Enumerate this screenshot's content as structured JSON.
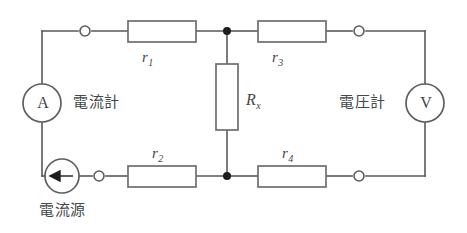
{
  "diagram": {
    "stroke_color": "#555a5e",
    "node_color": "#1b1d1f",
    "background": "#ffffff"
  },
  "instruments": {
    "ammeter": {
      "glyph": "A",
      "label": "電流計"
    },
    "voltmeter": {
      "glyph": "V",
      "label": "電圧計"
    },
    "current_source": {
      "label": "電流源",
      "arrow_direction": "left"
    }
  },
  "resistors": {
    "r1": {
      "symbol": "r",
      "subscript": "1"
    },
    "r2": {
      "symbol": "r",
      "subscript": "2"
    },
    "r3": {
      "symbol": "r",
      "subscript": "3"
    },
    "r4": {
      "symbol": "r",
      "subscript": "4"
    },
    "rx": {
      "symbol": "R",
      "subscript": "x"
    }
  }
}
